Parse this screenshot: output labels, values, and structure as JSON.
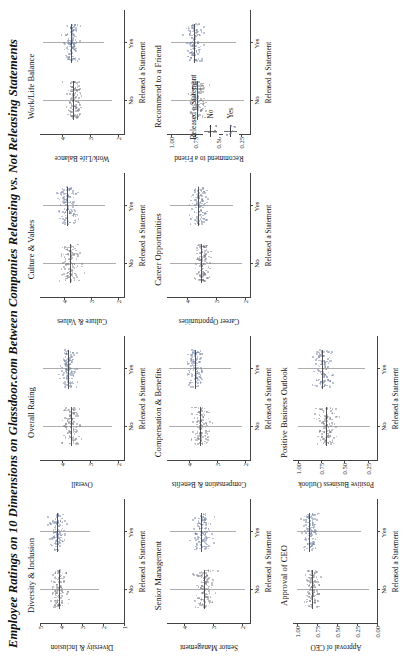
{
  "chart_data": {
    "type": "scatter",
    "title": "Employee Ratings on 10 Dimensions on Glassdoor.com Between Companies Releasing vs. Not Releasing Statements",
    "xlabel": "Released a Statement",
    "categories": [
      "No",
      "Yes"
    ],
    "legend": {
      "title": "Released a Statement",
      "entries": [
        {
          "label": "No",
          "color": "#787882"
        },
        {
          "label": "Yes",
          "color": "#6e7da0"
        }
      ],
      "position": "right"
    },
    "grid": false,
    "layout": {
      "rows": 3,
      "cols": 4,
      "empty_cells": [
        11
      ]
    },
    "panels": [
      {
        "title": "Diversity & Inclusion",
        "ylabel": "Diversity & Inclusion",
        "yticks": [
          "5",
          "4",
          "3",
          "2",
          "1"
        ],
        "ytick_values": [
          5,
          4,
          3,
          2,
          1
        ],
        "ylim": [
          1,
          5
        ],
        "series": [
          {
            "name": "No",
            "median": 4.1,
            "q1": 3.7,
            "q3": 4.5,
            "min": 2.2,
            "max": 5.0,
            "n": 120
          },
          {
            "name": "Yes",
            "median": 4.2,
            "q1": 3.8,
            "q3": 4.6,
            "min": 2.6,
            "max": 5.0,
            "n": 120
          }
        ]
      },
      {
        "title": "Overall Rating",
        "ylabel": "Overall",
        "yticks": [
          "4",
          "3",
          "2"
        ],
        "ytick_values": [
          4,
          3,
          2
        ],
        "ylim": [
          1.8,
          4.8
        ],
        "series": [
          {
            "name": "No",
            "median": 3.7,
            "q1": 3.4,
            "q3": 4.0,
            "min": 2.2,
            "max": 4.7,
            "n": 120
          },
          {
            "name": "Yes",
            "median": 3.8,
            "q1": 3.5,
            "q3": 4.1,
            "min": 2.6,
            "max": 4.7,
            "n": 120
          }
        ]
      },
      {
        "title": "Culture & Values",
        "ylabel": "Culture & Values",
        "yticks": [
          "4",
          "3",
          "2"
        ],
        "ytick_values": [
          4,
          3,
          2
        ],
        "ylim": [
          1.8,
          4.9
        ],
        "series": [
          {
            "name": "No",
            "median": 3.8,
            "q1": 3.4,
            "q3": 4.2,
            "min": 2.1,
            "max": 4.8,
            "n": 120
          },
          {
            "name": "Yes",
            "median": 3.9,
            "q1": 3.5,
            "q3": 4.3,
            "min": 2.5,
            "max": 4.8,
            "n": 120
          }
        ]
      },
      {
        "title": "Work/Life Balance",
        "ylabel": "Work/Life Balance",
        "yticks": [
          "4",
          "3",
          "2"
        ],
        "ytick_values": [
          4,
          3,
          2
        ],
        "ylim": [
          1.8,
          4.8
        ],
        "series": [
          {
            "name": "No",
            "median": 3.6,
            "q1": 3.3,
            "q3": 3.9,
            "min": 2.2,
            "max": 4.7,
            "n": 120
          },
          {
            "name": "Yes",
            "median": 3.7,
            "q1": 3.4,
            "q3": 4.0,
            "min": 2.5,
            "max": 4.7,
            "n": 120
          }
        ]
      },
      {
        "title": "Senior Management",
        "ylabel": "Senior Management",
        "yticks": [
          "4",
          "3",
          "2"
        ],
        "ytick_values": [
          4,
          3,
          2
        ],
        "ylim": [
          1.7,
          4.6
        ],
        "series": [
          {
            "name": "No",
            "median": 3.3,
            "q1": 3.0,
            "q3": 3.7,
            "min": 1.9,
            "max": 4.5,
            "n": 120
          },
          {
            "name": "Yes",
            "median": 3.4,
            "q1": 3.1,
            "q3": 3.8,
            "min": 2.2,
            "max": 4.5,
            "n": 120
          }
        ]
      },
      {
        "title": "Compensation & Benefits",
        "ylabel": "Compensation & Benefits",
        "yticks": [
          "4",
          "3",
          "2"
        ],
        "ytick_values": [
          4,
          3,
          2
        ],
        "ylim": [
          1.8,
          4.8
        ],
        "series": [
          {
            "name": "No",
            "median": 3.6,
            "q1": 3.3,
            "q3": 4.0,
            "min": 2.1,
            "max": 4.7,
            "n": 120
          },
          {
            "name": "Yes",
            "median": 3.8,
            "q1": 3.5,
            "q3": 4.1,
            "min": 2.5,
            "max": 4.7,
            "n": 120
          }
        ]
      },
      {
        "title": "Career Opportunities",
        "ylabel": "Career Opportunities",
        "yticks": [
          "4",
          "3",
          "2"
        ],
        "ytick_values": [
          4,
          3,
          2
        ],
        "ylim": [
          1.8,
          4.7
        ],
        "series": [
          {
            "name": "No",
            "median": 3.5,
            "q1": 3.2,
            "q3": 3.8,
            "min": 2.1,
            "max": 4.6,
            "n": 120
          },
          {
            "name": "Yes",
            "median": 3.6,
            "q1": 3.3,
            "q3": 3.9,
            "min": 2.4,
            "max": 4.6,
            "n": 120
          }
        ]
      },
      {
        "title": "Recommend to a Friend",
        "ylabel": "Recommend to a Friend",
        "yticks": [
          "1.00",
          "0.75",
          "0.50",
          "0.25"
        ],
        "ytick_values": [
          1.0,
          0.75,
          0.5,
          0.25
        ],
        "ylim": [
          0.15,
          1.05
        ],
        "series": [
          {
            "name": "No",
            "median": 0.72,
            "q1": 0.6,
            "q3": 0.84,
            "min": 0.22,
            "max": 1.0,
            "n": 120
          },
          {
            "name": "Yes",
            "median": 0.76,
            "q1": 0.65,
            "q3": 0.86,
            "min": 0.3,
            "max": 1.0,
            "n": 120
          }
        ]
      },
      {
        "title": "Approval of CEO",
        "ylabel": "Approval of CEO",
        "yticks": [
          "1.00",
          "0.75",
          "0.50",
          "0.25",
          "0.00"
        ],
        "ytick_values": [
          1.0,
          0.75,
          0.5,
          0.25,
          0.0
        ],
        "ylim": [
          0.0,
          1.05
        ],
        "series": [
          {
            "name": "No",
            "median": 0.82,
            "q1": 0.7,
            "q3": 0.92,
            "min": 0.1,
            "max": 1.0,
            "n": 120
          },
          {
            "name": "Yes",
            "median": 0.85,
            "q1": 0.74,
            "q3": 0.94,
            "min": 0.2,
            "max": 1.0,
            "n": 120
          }
        ]
      },
      {
        "title": "Positive Business Outlook",
        "ylabel": "Positive Business Outlook",
        "yticks": [
          "1.00",
          "0.75",
          "0.50",
          "0.25"
        ],
        "ytick_values": [
          1.0,
          0.75,
          0.5,
          0.25
        ],
        "ylim": [
          0.15,
          1.05
        ],
        "series": [
          {
            "name": "No",
            "median": 0.7,
            "q1": 0.58,
            "q3": 0.82,
            "min": 0.22,
            "max": 1.0,
            "n": 120
          },
          {
            "name": "Yes",
            "median": 0.74,
            "q1": 0.62,
            "q3": 0.85,
            "min": 0.28,
            "max": 1.0,
            "n": 120
          }
        ]
      }
    ]
  }
}
